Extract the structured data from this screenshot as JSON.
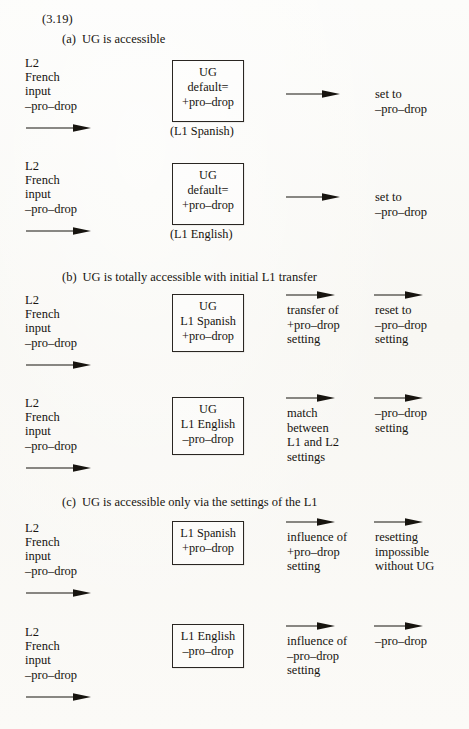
{
  "document": {
    "example_number": "(3.19)",
    "sections": [
      {
        "label": "(a)",
        "title": "UG is accessible",
        "rows": [
          {
            "input_lines": [
              "L2",
              "French",
              "input",
              "–pro–drop"
            ],
            "box_lines": [
              "UG",
              "default=",
              "+pro–drop"
            ],
            "box_caption": "(L1 Spanish)",
            "steps": [
              {
                "arrow": "right-arrow",
                "lines": [
                  "set to",
                  "–pro–drop"
                ]
              }
            ]
          },
          {
            "input_lines": [
              "L2",
              "French",
              "input",
              "–pro–drop"
            ],
            "box_lines": [
              "UG",
              "default=",
              "+pro–drop"
            ],
            "box_caption": "(L1 English)",
            "steps": [
              {
                "arrow": "right-arrow",
                "lines": [
                  "set to",
                  "–pro–drop"
                ]
              }
            ]
          }
        ]
      },
      {
        "label": "(b)",
        "title": "UG is totally accessible with initial L1 transfer",
        "rows": [
          {
            "input_lines": [
              "L2",
              "French",
              "input",
              "–pro–drop"
            ],
            "box_lines": [
              "UG",
              "L1 Spanish",
              "+pro–drop"
            ],
            "box_caption": "",
            "steps": [
              {
                "arrow": "right-arrow",
                "lines": [
                  "transfer of",
                  "+pro–drop",
                  "setting"
                ]
              },
              {
                "arrow": "right-arrow",
                "lines": [
                  "reset to",
                  "–pro–drop",
                  "setting"
                ]
              }
            ]
          },
          {
            "input_lines": [
              "L2",
              "French",
              "input",
              "–pro–drop"
            ],
            "box_lines": [
              "UG",
              "L1 English",
              "–pro–drop"
            ],
            "box_caption": "",
            "steps": [
              {
                "arrow": "right-arrow",
                "lines": [
                  "match",
                  "between",
                  "L1 and L2",
                  "settings"
                ]
              },
              {
                "arrow": "right-arrow",
                "lines": [
                  "–pro–drop",
                  "setting"
                ]
              }
            ]
          }
        ]
      },
      {
        "label": "(c)",
        "title": "UG is accessible only via the settings of the L1",
        "rows": [
          {
            "input_lines": [
              "L2",
              "French",
              "input",
              "–pro–drop"
            ],
            "box_lines": [
              "L1 Spanish",
              "+pro–drop"
            ],
            "box_caption": "",
            "steps": [
              {
                "arrow": "right-arrow",
                "lines": [
                  "influence of",
                  "+pro–drop",
                  "setting"
                ]
              },
              {
                "arrow": "right-arrow",
                "lines": [
                  "resetting",
                  "impossible",
                  "without UG"
                ]
              }
            ]
          },
          {
            "input_lines": [
              "L2",
              "French",
              "input",
              "–pro–drop"
            ],
            "box_lines": [
              "L1 English",
              "–pro–drop"
            ],
            "box_caption": "",
            "steps": [
              {
                "arrow": "right-arrow",
                "lines": [
                  "influence of",
                  "–pro–drop",
                  "setting"
                ]
              },
              {
                "arrow": "right-arrow",
                "lines": [
                  "–pro–drop"
                ]
              }
            ]
          }
        ]
      }
    ]
  },
  "colors": {
    "ink": "#17140f",
    "paper": "#fbfbf9"
  },
  "a": {
    "head": "(a)",
    "title": "UG is accessible",
    "r1": {
      "in": [
        "L2",
        "French",
        "input",
        "–pro–drop"
      ],
      "box": [
        "UG",
        "default=",
        "+pro–drop"
      ],
      "cap": "(L1 Spanish)",
      "out": [
        "set to",
        "–pro–drop"
      ]
    },
    "r2": {
      "in": [
        "L2",
        "French",
        "input",
        "–pro–drop"
      ],
      "box": [
        "UG",
        "default=",
        "+pro–drop"
      ],
      "cap": "(L1 English)",
      "out": [
        "set to",
        "–pro–drop"
      ]
    }
  },
  "b": {
    "head": "(b)",
    "title": "UG is totally accessible with initial L1 transfer",
    "r1": {
      "in": [
        "L2",
        "French",
        "input",
        "–pro–drop"
      ],
      "box": [
        "UG",
        "L1 Spanish",
        "+pro–drop"
      ],
      "c3": [
        "transfer of",
        "+pro–drop",
        "setting"
      ],
      "c4": [
        "reset to",
        "–pro–drop",
        "setting"
      ]
    },
    "r2": {
      "in": [
        "L2",
        "French",
        "input",
        "–pro–drop"
      ],
      "box": [
        "UG",
        "L1 English",
        "–pro–drop"
      ],
      "c3": [
        "match",
        "between",
        "L1 and L2",
        "settings"
      ],
      "c4": [
        "–pro–drop",
        "setting"
      ]
    }
  },
  "c": {
    "head": "(c)",
    "title": "UG is accessible only via the settings of the L1",
    "r1": {
      "in": [
        "L2",
        "French",
        "input",
        "–pro–drop"
      ],
      "box": [
        "L1 Spanish",
        "+pro–drop"
      ],
      "c3": [
        "influence of",
        "+pro–drop",
        "setting"
      ],
      "c4": [
        "resetting",
        "impossible",
        "without UG"
      ]
    },
    "r2": {
      "in": [
        "L2",
        "French",
        "input",
        "–pro–drop"
      ],
      "box": [
        "L1 English",
        "–pro–drop"
      ],
      "c3": [
        "influence of",
        "–pro–drop",
        "setting"
      ],
      "c4": [
        "–pro–drop"
      ]
    }
  }
}
